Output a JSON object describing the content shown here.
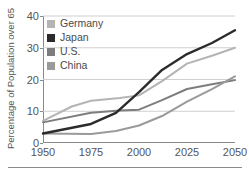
{
  "chart_data": {
    "type": "line",
    "title": "",
    "xlabel": "",
    "ylabel": "Percentage of Population over 65",
    "x": [
      1950,
      1975,
      2000,
      2025,
      2050
    ],
    "xticklabels": [
      "1950",
      "1975",
      "2000",
      "2025",
      "2050"
    ],
    "yticklabels": [
      "0",
      "10",
      "20",
      "30",
      "40"
    ],
    "xlim": [
      1950,
      2050
    ],
    "ylim": [
      0,
      40
    ],
    "grid": "horizontal",
    "legend_position": "upper-left",
    "series": [
      {
        "name": "Germany",
        "color": "#b4b4b4",
        "values": [
          7.0,
          13.5,
          15.0,
          25.0,
          30.0
        ],
        "dense_x": [
          1950,
          1965,
          1975,
          1990,
          2000,
          2012,
          2025,
          2038,
          2050
        ],
        "dense_values": [
          7.0,
          11.5,
          13.3,
          14.2,
          15.0,
          19.5,
          25.0,
          27.5,
          30.0
        ]
      },
      {
        "name": "Japan",
        "color": "#2b2b2b",
        "values": [
          3.0,
          6.0,
          16.0,
          28.0,
          35.5
        ],
        "dense_x": [
          1950,
          1975,
          1988,
          2000,
          2012,
          2025,
          2038,
          2050
        ],
        "dense_values": [
          3.0,
          6.0,
          9.5,
          16.0,
          23.0,
          28.0,
          31.5,
          35.5
        ]
      },
      {
        "name": "U.S.",
        "color": "#7d7d7d",
        "values": [
          6.5,
          9.5,
          10.5,
          17.0,
          19.8
        ],
        "dense_x": [
          1950,
          1975,
          1990,
          2000,
          2012,
          2025,
          2038,
          2050
        ],
        "dense_values": [
          6.5,
          9.5,
          10.2,
          10.5,
          13.5,
          17.0,
          18.5,
          19.8
        ]
      },
      {
        "name": "China",
        "color": "#9a9a9a",
        "values": [
          3.0,
          2.8,
          5.5,
          13.0,
          21.0
        ],
        "dense_x": [
          1950,
          1975,
          1988,
          2000,
          2012,
          2025,
          2038,
          2050
        ],
        "dense_values": [
          3.0,
          2.8,
          3.8,
          5.5,
          8.5,
          13.0,
          17.0,
          21.0
        ]
      }
    ]
  },
  "legend": {
    "items": [
      {
        "label": "Germany",
        "color": "#b4b4b4"
      },
      {
        "label": "Japan",
        "color": "#2b2b2b"
      },
      {
        "label": "U.S.",
        "color": "#7d7d7d"
      },
      {
        "label": "China",
        "color": "#9a9a9a"
      }
    ]
  },
  "axes": {
    "y_title": "Percentage of Population over 65",
    "y_ticks": [
      "40",
      "30",
      "20",
      "10",
      "0"
    ],
    "x_ticks": [
      "1950",
      "1975",
      "2000",
      "2025",
      "2050"
    ]
  },
  "colors": {
    "axis": "#8a8a8a",
    "grid": "#d0d0d0",
    "text": "#4a4a4a"
  }
}
